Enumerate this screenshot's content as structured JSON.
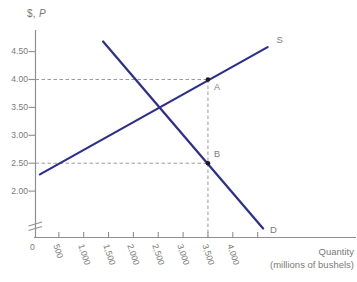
{
  "chart_data": {
    "type": "line",
    "title": "",
    "ylabel": "$, P",
    "ylabel_prefix": "$,",
    "ylabel_var": "P",
    "xlabel": "Quantity (millions of bushels)",
    "xlabel_lines": [
      "Quantity",
      "(millions of bushels)"
    ],
    "xlim": [
      0,
      4800
    ],
    "ylim_visible": [
      2.0,
      4.5
    ],
    "grid": false,
    "y_axis": {
      "has_break": true,
      "ticks": [
        {
          "v": 2.0,
          "label": "2.00"
        },
        {
          "v": 2.5,
          "label": "2.50"
        },
        {
          "v": 3.0,
          "label": "3.00"
        },
        {
          "v": 3.5,
          "label": "3.50"
        },
        {
          "v": 4.0,
          "label": "4.00"
        },
        {
          "v": 4.5,
          "label": "4.50"
        }
      ]
    },
    "x_axis": {
      "ticks": [
        {
          "v": 0,
          "label": "0"
        },
        {
          "v": 500,
          "label": "500"
        },
        {
          "v": 1000,
          "label": "1,000"
        },
        {
          "v": 1500,
          "label": "1,500"
        },
        {
          "v": 2000,
          "label": "2,000"
        },
        {
          "v": 2500,
          "label": "2,500"
        },
        {
          "v": 3000,
          "label": "3,000"
        },
        {
          "v": 3500,
          "label": "3,500"
        },
        {
          "v": 4000,
          "label": "4,000"
        },
        {
          "v": 4500,
          "label": ""
        }
      ]
    },
    "series": [
      {
        "name": "supply",
        "label": "S",
        "points": [
          [
            120,
            2.3
          ],
          [
            4700,
            4.58
          ]
        ]
      },
      {
        "name": "demand",
        "label": "D",
        "points": [
          [
            1390,
            4.68
          ],
          [
            4610,
            1.33
          ]
        ]
      }
    ],
    "points": [
      {
        "label": "A",
        "q": 3500,
        "p": 4.0
      },
      {
        "label": "B",
        "q": 3500,
        "p": 2.5
      }
    ],
    "guides": [
      {
        "type": "h",
        "p": 4.0,
        "to_q": 3500
      },
      {
        "type": "h",
        "p": 2.5,
        "to_q": 3500
      },
      {
        "type": "v",
        "q": 3500,
        "from_p": 4.0
      }
    ],
    "colors": {
      "curve": "#2d2f90",
      "axis": "#8f8f8f",
      "text": "#7b7a76",
      "dashed": "#9a9a9a",
      "point": "#1b1b1b"
    }
  }
}
